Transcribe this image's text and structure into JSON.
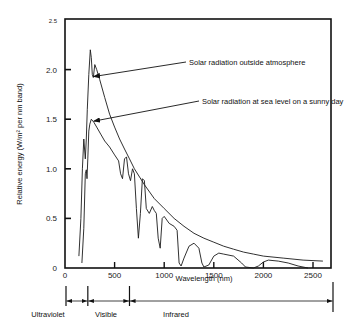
{
  "chart_data": {
    "type": "line",
    "title": "",
    "xlabel": "Wavelength (nm)",
    "ylabel": "Relative energy (W/m² per nm band)",
    "xlim": [
      0,
      2700
    ],
    "ylim": [
      0,
      2.5
    ],
    "x_ticks": [
      0,
      500,
      1000,
      1500,
      2000,
      2500
    ],
    "y_ticks": [
      0,
      0.5,
      1.0,
      1.5,
      2.0,
      2.5
    ],
    "y_tick_labels": [
      "0",
      "0.5",
      "1.0",
      "1.5",
      "2.0",
      "2.5"
    ],
    "grid": false,
    "series": [
      {
        "name": "Solar radiation outside atmosphere",
        "points": [
          [
            140,
            0.12
          ],
          [
            160,
            0.5
          ],
          [
            175,
            1.0
          ],
          [
            190,
            1.3
          ],
          [
            205,
            1.1
          ],
          [
            215,
            1.3
          ],
          [
            225,
            1.6
          ],
          [
            240,
            1.95
          ],
          [
            255,
            2.2
          ],
          [
            265,
            2.12
          ],
          [
            275,
            1.95
          ],
          [
            285,
            1.92
          ],
          [
            300,
            2.05
          ],
          [
            320,
            2.0
          ],
          [
            350,
            1.9
          ],
          [
            400,
            1.72
          ],
          [
            450,
            1.55
          ],
          [
            500,
            1.42
          ],
          [
            550,
            1.3
          ],
          [
            600,
            1.2
          ],
          [
            650,
            1.1
          ],
          [
            700,
            1.0
          ],
          [
            800,
            0.84
          ],
          [
            900,
            0.7
          ],
          [
            1000,
            0.6
          ],
          [
            1100,
            0.5
          ],
          [
            1200,
            0.42
          ],
          [
            1300,
            0.35
          ],
          [
            1400,
            0.3
          ],
          [
            1500,
            0.26
          ],
          [
            1600,
            0.22
          ],
          [
            1700,
            0.19
          ],
          [
            1800,
            0.16
          ],
          [
            1900,
            0.14
          ],
          [
            2000,
            0.12
          ],
          [
            2200,
            0.1
          ],
          [
            2400,
            0.08
          ],
          [
            2600,
            0.07
          ]
        ]
      },
      {
        "name": "Solar radiation at sea level on a sunny day",
        "points": [
          [
            170,
            0.05
          ],
          [
            190,
            0.4
          ],
          [
            205,
            0.95
          ],
          [
            215,
            0.99
          ],
          [
            222,
            0.9
          ],
          [
            230,
            1.1
          ],
          [
            240,
            1.38
          ],
          [
            250,
            1.45
          ],
          [
            265,
            1.5
          ],
          [
            290,
            1.47
          ],
          [
            320,
            1.42
          ],
          [
            360,
            1.35
          ],
          [
            400,
            1.28
          ],
          [
            450,
            1.22
          ],
          [
            500,
            1.14
          ],
          [
            540,
            1.08
          ],
          [
            560,
            0.95
          ],
          [
            580,
            0.9
          ],
          [
            600,
            1.1
          ],
          [
            620,
            1.12
          ],
          [
            640,
            0.95
          ],
          [
            660,
            0.88
          ],
          [
            680,
            1.0
          ],
          [
            700,
            0.95
          ],
          [
            720,
            0.6
          ],
          [
            740,
            0.3
          ],
          [
            760,
            0.55
          ],
          [
            780,
            0.9
          ],
          [
            800,
            0.88
          ],
          [
            820,
            0.6
          ],
          [
            850,
            0.55
          ],
          [
            880,
            0.62
          ],
          [
            900,
            0.58
          ],
          [
            920,
            0.55
          ],
          [
            940,
            0.3
          ],
          [
            960,
            0.2
          ],
          [
            980,
            0.5
          ],
          [
            1000,
            0.52
          ],
          [
            1050,
            0.45
          ],
          [
            1100,
            0.42
          ],
          [
            1130,
            0.38
          ],
          [
            1150,
            0.05
          ],
          [
            1170,
            0.02
          ],
          [
            1200,
            0.1
          ],
          [
            1250,
            0.22
          ],
          [
            1300,
            0.25
          ],
          [
            1350,
            0.2
          ],
          [
            1380,
            0.05
          ],
          [
            1400,
            0.01
          ],
          [
            1450,
            0.03
          ],
          [
            1500,
            0.12
          ],
          [
            1550,
            0.15
          ],
          [
            1600,
            0.14
          ],
          [
            1700,
            0.12
          ],
          [
            1780,
            0.05
          ],
          [
            1820,
            0.01
          ],
          [
            1900,
            0.0
          ],
          [
            1950,
            0.02
          ],
          [
            2000,
            0.06
          ],
          [
            2050,
            0.08
          ],
          [
            2150,
            0.07
          ],
          [
            2250,
            0.05
          ],
          [
            2350,
            0.02
          ],
          [
            2450,
            0.0
          ]
        ]
      }
    ],
    "annotations": [
      {
        "text": "Solar radiation outside atmosphere",
        "target_x": 270,
        "target_y": 1.93
      },
      {
        "text": "Solar radiation at sea level on a sunny day",
        "target_x": 270,
        "target_y": 1.48
      }
    ],
    "bands": [
      {
        "name": "Ultraviolet",
        "from": 0,
        "to": 220
      },
      {
        "name": "Visible",
        "from": 220,
        "to": 640
      },
      {
        "name": "Infrared",
        "from": 640,
        "to": 2700
      }
    ]
  }
}
